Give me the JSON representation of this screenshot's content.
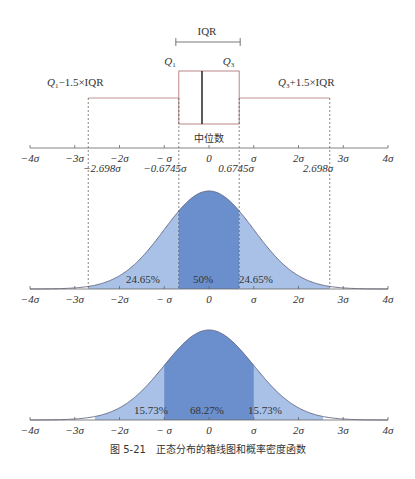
{
  "boxplot": {
    "iqr_label": "IQR",
    "q1_label": "Q",
    "q1_sub": "1",
    "q3_label": "Q",
    "q3_sub": "3",
    "lower_whisker_label": "Q1−1.5×IQR",
    "lower_whisker_prefix": "Q",
    "lower_whisker_sub": "1",
    "lower_whisker_suffix": "−1.5×IQR",
    "upper_whisker_prefix": "Q",
    "upper_whisker_sub": "3",
    "upper_whisker_suffix": "+1.5×IQR",
    "median_label": "中位数",
    "marks": [
      "−2.698σ",
      "−0.6745σ",
      "0.6745σ",
      "2.698σ"
    ]
  },
  "axis_ticks": [
    "−4σ",
    "−3σ",
    "−2σ",
    "− σ",
    "0",
    "σ",
    "2σ",
    "3σ",
    "4σ"
  ],
  "pdf1": {
    "left_pct": "24.65%",
    "center_pct": "50%",
    "right_pct": "24.65%"
  },
  "pdf2": {
    "left_pct": "15.73%",
    "center_pct": "68.27%",
    "right_pct": "15.73%"
  },
  "caption": "图 5-21　正态分布的箱线图和概率密度函数",
  "colors": {
    "light_fill": "#a9c1e6",
    "dark_fill": "#6b8fcc",
    "curve": "#6a6f8a",
    "whisker": "#b27a7a",
    "axis": "#666666"
  },
  "chart_data": [
    {
      "type": "boxplot",
      "title": "",
      "q1": -0.6745,
      "median": 0,
      "q3": 0.6745,
      "lower_whisker": -2.698,
      "upper_whisker": 2.698,
      "unit": "σ",
      "labels": [
        "IQR",
        "Q1",
        "Q3",
        "Q1−1.5×IQR",
        "Q3+1.5×IQR",
        "中位数"
      ]
    },
    {
      "type": "area",
      "title": "Normal PDF — IQR regions",
      "x_ticks": [
        "−4σ",
        "−3σ",
        "−2σ",
        "−σ",
        "0",
        "σ",
        "2σ",
        "3σ",
        "4σ"
      ],
      "regions": [
        {
          "from": -2.698,
          "to": -0.6745,
          "label": "24.65%"
        },
        {
          "from": -0.6745,
          "to": 0.6745,
          "label": "50%"
        },
        {
          "from": 0.6745,
          "to": 2.698,
          "label": "24.65%"
        }
      ],
      "xlim": [
        -4,
        4
      ]
    },
    {
      "type": "area",
      "title": "Normal PDF — 1σ regions",
      "x_ticks": [
        "−4σ",
        "−3σ",
        "−2σ",
        "−σ",
        "0",
        "σ",
        "2σ",
        "3σ",
        "4σ"
      ],
      "regions": [
        {
          "from": -2.5,
          "to": -1,
          "label": "15.73%"
        },
        {
          "from": -1,
          "to": 1,
          "label": "68.27%"
        },
        {
          "from": 1,
          "to": 2.5,
          "label": "15.73%"
        }
      ],
      "xlim": [
        -4,
        4
      ]
    }
  ]
}
